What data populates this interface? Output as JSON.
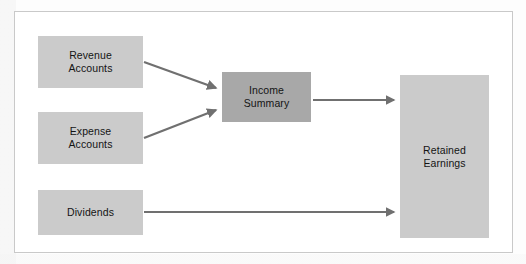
{
  "diagram": {
    "background_color": "#ffffff",
    "frame_border_color": "#c9c9c9",
    "node_fill_light": "#cbcbcb",
    "node_fill_dark": "#a8a8a8",
    "arrow_color": "#707070",
    "text_color": "#141414",
    "nodes": [
      {
        "id": "revenue-accounts",
        "label": "Revenue\nAccounts",
        "line1": "Revenue",
        "line2": "Accounts",
        "fill": "#cbcbcb"
      },
      {
        "id": "expense-accounts",
        "label": "Expense\nAccounts",
        "line1": "Expense",
        "line2": "Accounts",
        "fill": "#cbcbcb"
      },
      {
        "id": "dividends",
        "label": "Dividends",
        "line1": "Dividends",
        "line2": "",
        "fill": "#cbcbcb"
      },
      {
        "id": "income-summary",
        "label": "Income\nSummary",
        "line1": "Income",
        "line2": "Summary",
        "fill": "#a8a8a8"
      },
      {
        "id": "retained-earnings",
        "label": "Retained\nEarnings",
        "line1": "Retained",
        "line2": "Earnings",
        "fill": "#cbcbcb"
      }
    ],
    "arrows": [
      {
        "id": "revenue-to-income-summary",
        "from": "revenue-accounts",
        "to": "income-summary",
        "direction": "diagonal-down-right"
      },
      {
        "id": "expense-to-income-summary",
        "from": "expense-accounts",
        "to": "income-summary",
        "direction": "diagonal-up-right"
      },
      {
        "id": "income-summary-to-retained-earnings",
        "from": "income-summary",
        "to": "retained-earnings",
        "direction": "horizontal-right"
      },
      {
        "id": "dividends-to-retained-earnings",
        "from": "dividends",
        "to": "retained-earnings",
        "direction": "horizontal-right"
      }
    ]
  }
}
